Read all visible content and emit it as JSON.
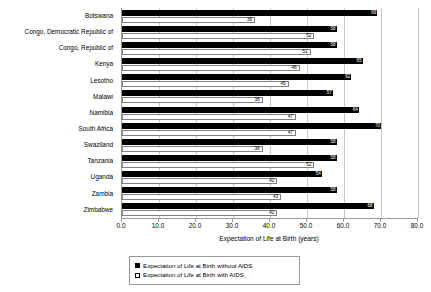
{
  "chart_data": {
    "type": "bar",
    "orientation": "horizontal",
    "title": "",
    "xlabel": "Expectation of Life at Birth (years)",
    "ylabel": "",
    "xlim": [
      0.0,
      80.0
    ],
    "xticks": [
      "0.0",
      "10.0",
      "20.0",
      "30.0",
      "40.0",
      "50.0",
      "60.0",
      "70.0",
      "80.0"
    ],
    "xtick_values": [
      0,
      10,
      20,
      30,
      40,
      50,
      60,
      70,
      80
    ],
    "grid": true,
    "grid_axis": "x",
    "legend_position": "bottom",
    "categories": [
      "Botswana",
      "Congo, Democratic Republic of",
      "Congo, Republic of",
      "Kenya",
      "Lesotho",
      "Malawi",
      "Namibia",
      "South Africa",
      "Swaziland",
      "Tanzania",
      "Uganda",
      "Zambia",
      "Zimbabwe"
    ],
    "series": [
      {
        "name": "Expectation of Life at Birth without AIDS",
        "color": "#000000",
        "values": [
          69,
          58,
          58,
          65,
          62,
          57,
          64,
          70,
          58,
          58,
          54,
          58,
          68
        ]
      },
      {
        "name": "Expectation of Life at Birth with AIDS",
        "color": "#ffffff",
        "values": [
          36,
          52,
          51,
          48,
          45,
          38,
          47,
          47,
          38,
          52,
          42,
          43,
          42
        ]
      }
    ]
  },
  "axis": {
    "x_title": "Expectation of Life at Birth (years)"
  },
  "legend": {
    "entries": [
      {
        "label": "Expectation of Life at Birth without AIDS",
        "swatch": "filled-square"
      },
      {
        "label": "Expectation of Life at Birth with AIDS",
        "swatch": "hollow-square"
      }
    ]
  }
}
